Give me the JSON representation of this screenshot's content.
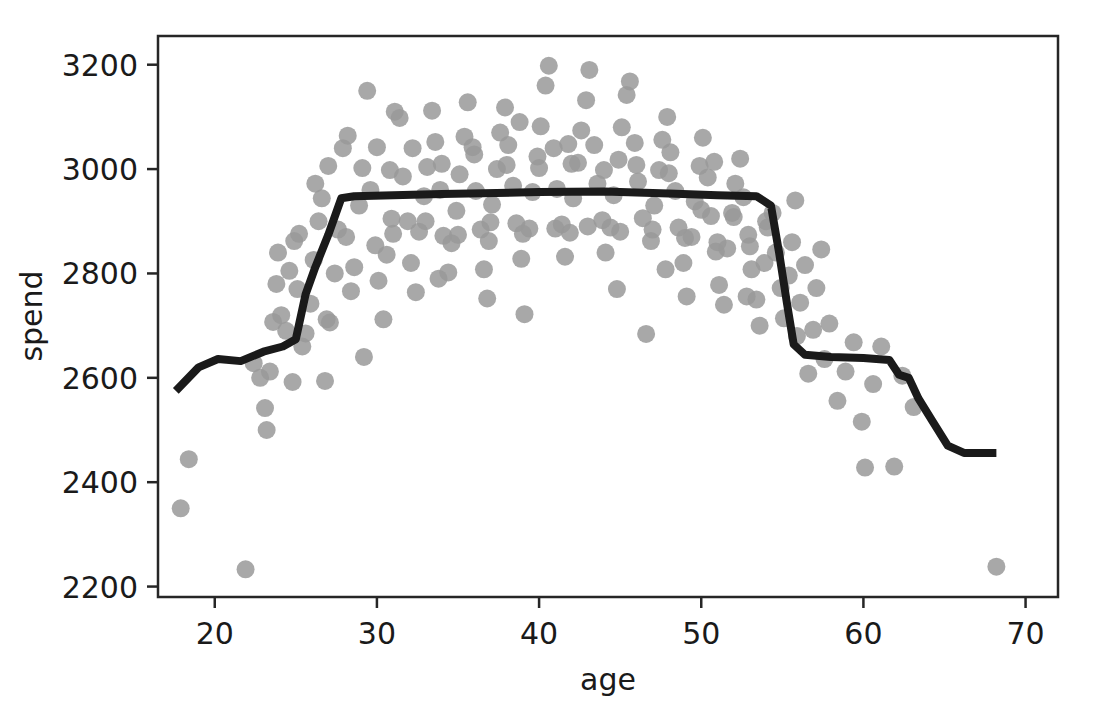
{
  "top_clipped_text": "",
  "chart_data": {
    "type": "scatter",
    "title": "",
    "xlabel": "age",
    "ylabel": "spend",
    "xlim": [
      16.5,
      72.0
    ],
    "ylim": [
      2180,
      3255
    ],
    "xticks": [
      20,
      30,
      40,
      50,
      60,
      70
    ],
    "yticks": [
      2200,
      2400,
      2600,
      2800,
      3000,
      3200
    ],
    "grid": false,
    "legend": null,
    "marker": {
      "shape": "circle",
      "color": "#999999",
      "size_px": 18,
      "alpha": 0.85
    },
    "series": [
      {
        "name": "observations",
        "type": "scatter",
        "points": [
          [
            17.9,
            2350
          ],
          [
            18.4,
            2444
          ],
          [
            21.9,
            2233
          ],
          [
            22.4,
            2628
          ],
          [
            23.1,
            2542
          ],
          [
            23.2,
            2500
          ],
          [
            23.4,
            2612
          ],
          [
            23.6,
            2707
          ],
          [
            23.9,
            2840
          ],
          [
            24.1,
            2720
          ],
          [
            24.4,
            2690
          ],
          [
            24.6,
            2805
          ],
          [
            24.9,
            2862
          ],
          [
            25.1,
            2770
          ],
          [
            25.4,
            2660
          ],
          [
            25.6,
            2685
          ],
          [
            25.9,
            2742
          ],
          [
            26.1,
            2826
          ],
          [
            26.4,
            2900
          ],
          [
            26.6,
            2944
          ],
          [
            26.9,
            2712
          ],
          [
            27.1,
            2706
          ],
          [
            27.4,
            2800
          ],
          [
            27.6,
            2884
          ],
          [
            27.9,
            3040
          ],
          [
            28.1,
            2870
          ],
          [
            28.4,
            2766
          ],
          [
            28.6,
            2812
          ],
          [
            28.9,
            2930
          ],
          [
            29.1,
            3002
          ],
          [
            29.4,
            3150
          ],
          [
            29.6,
            2960
          ],
          [
            29.9,
            2854
          ],
          [
            30.1,
            2786
          ],
          [
            30.4,
            2712
          ],
          [
            30.6,
            2836
          ],
          [
            30.9,
            2905
          ],
          [
            31.1,
            3110
          ],
          [
            31.4,
            3098
          ],
          [
            31.6,
            2986
          ],
          [
            31.9,
            2900
          ],
          [
            32.1,
            2820
          ],
          [
            32.4,
            2764
          ],
          [
            32.6,
            2880
          ],
          [
            32.9,
            2948
          ],
          [
            33.1,
            3004
          ],
          [
            33.4,
            3112
          ],
          [
            33.6,
            3052
          ],
          [
            33.9,
            2960
          ],
          [
            34.1,
            2872
          ],
          [
            34.4,
            2802
          ],
          [
            34.6,
            2858
          ],
          [
            34.9,
            2920
          ],
          [
            35.1,
            2990
          ],
          [
            35.4,
            3062
          ],
          [
            35.6,
            3128
          ],
          [
            35.9,
            3042
          ],
          [
            36.1,
            2958
          ],
          [
            36.4,
            2884
          ],
          [
            36.6,
            2808
          ],
          [
            36.9,
            2862
          ],
          [
            37.1,
            2932
          ],
          [
            37.4,
            3000
          ],
          [
            37.6,
            3070
          ],
          [
            37.9,
            3118
          ],
          [
            38.1,
            3046
          ],
          [
            38.4,
            2968
          ],
          [
            38.6,
            2896
          ],
          [
            38.9,
            2828
          ],
          [
            39.1,
            2722
          ],
          [
            39.4,
            2886
          ],
          [
            39.6,
            2956
          ],
          [
            39.9,
            3024
          ],
          [
            40.1,
            3082
          ],
          [
            40.4,
            3160
          ],
          [
            40.6,
            3198
          ],
          [
            40.9,
            3040
          ],
          [
            41.1,
            2962
          ],
          [
            41.4,
            2894
          ],
          [
            41.6,
            2832
          ],
          [
            41.9,
            2878
          ],
          [
            42.1,
            2944
          ],
          [
            42.4,
            3012
          ],
          [
            42.6,
            3074
          ],
          [
            42.9,
            3132
          ],
          [
            43.1,
            3190
          ],
          [
            43.4,
            3046
          ],
          [
            43.6,
            2972
          ],
          [
            43.9,
            2902
          ],
          [
            44.1,
            2840
          ],
          [
            44.4,
            2888
          ],
          [
            44.6,
            2950
          ],
          [
            44.9,
            3018
          ],
          [
            45.1,
            3080
          ],
          [
            45.4,
            3142
          ],
          [
            45.6,
            3168
          ],
          [
            45.9,
            3050
          ],
          [
            46.1,
            2976
          ],
          [
            46.4,
            2906
          ],
          [
            46.6,
            2684
          ],
          [
            46.9,
            2862
          ],
          [
            47.1,
            2930
          ],
          [
            47.4,
            2998
          ],
          [
            47.6,
            3056
          ],
          [
            47.9,
            3100
          ],
          [
            48.1,
            3032
          ],
          [
            48.4,
            2958
          ],
          [
            48.6,
            2888
          ],
          [
            48.9,
            2820
          ],
          [
            49.1,
            2756
          ],
          [
            49.4,
            2870
          ],
          [
            49.6,
            2938
          ],
          [
            49.9,
            3006
          ],
          [
            50.1,
            3060
          ],
          [
            50.4,
            2984
          ],
          [
            50.6,
            2910
          ],
          [
            50.9,
            2842
          ],
          [
            51.1,
            2778
          ],
          [
            51.4,
            2740
          ],
          [
            51.6,
            2848
          ],
          [
            51.9,
            2916
          ],
          [
            52.1,
            2972
          ],
          [
            52.4,
            3020
          ],
          [
            52.6,
            2946
          ],
          [
            52.9,
            2874
          ],
          [
            53.1,
            2808
          ],
          [
            53.4,
            2750
          ],
          [
            53.6,
            2700
          ],
          [
            53.9,
            2820
          ],
          [
            54.1,
            2888
          ],
          [
            54.4,
            2916
          ],
          [
            54.6,
            2840
          ],
          [
            54.9,
            2772
          ],
          [
            55.1,
            2714
          ],
          [
            55.4,
            2796
          ],
          [
            55.6,
            2860
          ],
          [
            55.9,
            2680
          ],
          [
            56.1,
            2744
          ],
          [
            56.4,
            2816
          ],
          [
            56.6,
            2608
          ],
          [
            56.9,
            2692
          ],
          [
            57.1,
            2772
          ],
          [
            57.4,
            2846
          ],
          [
            57.6,
            2636
          ],
          [
            57.9,
            2704
          ],
          [
            58.4,
            2556
          ],
          [
            58.9,
            2612
          ],
          [
            59.4,
            2668
          ],
          [
            59.9,
            2516
          ],
          [
            60.1,
            2428
          ],
          [
            60.6,
            2588
          ],
          [
            61.1,
            2660
          ],
          [
            61.9,
            2430
          ],
          [
            62.4,
            2604
          ],
          [
            63.1,
            2544
          ],
          [
            68.2,
            2238
          ],
          [
            26.2,
            2972
          ],
          [
            27.0,
            3006
          ],
          [
            28.2,
            3064
          ],
          [
            30.0,
            3042
          ],
          [
            31.0,
            2876
          ],
          [
            32.2,
            3040
          ],
          [
            33.0,
            2900
          ],
          [
            34.0,
            3010
          ],
          [
            35.0,
            2874
          ],
          [
            36.0,
            3028
          ],
          [
            37.0,
            2898
          ],
          [
            38.0,
            3008
          ],
          [
            39.0,
            2876
          ],
          [
            40.0,
            3002
          ],
          [
            41.0,
            2886
          ],
          [
            42.0,
            3010
          ],
          [
            43.0,
            2890
          ],
          [
            44.0,
            2998
          ],
          [
            45.0,
            2880
          ],
          [
            46.0,
            3008
          ],
          [
            47.0,
            2884
          ],
          [
            48.0,
            2992
          ],
          [
            49.0,
            2868
          ],
          [
            50.0,
            2922
          ],
          [
            51.0,
            2860
          ],
          [
            52.0,
            2908
          ],
          [
            53.0,
            2852
          ],
          [
            54.0,
            2900
          ],
          [
            26.8,
            2594
          ],
          [
            24.8,
            2592
          ],
          [
            25.2,
            2876
          ],
          [
            29.2,
            2640
          ],
          [
            30.8,
            2998
          ],
          [
            33.8,
            2790
          ],
          [
            36.8,
            2752
          ],
          [
            38.8,
            3090
          ],
          [
            41.8,
            3048
          ],
          [
            44.8,
            2770
          ],
          [
            47.8,
            2808
          ],
          [
            50.8,
            3014
          ],
          [
            52.8,
            2756
          ],
          [
            55.8,
            2940
          ],
          [
            23.8,
            2780
          ],
          [
            22.8,
            2600
          ]
        ]
      },
      {
        "name": "fitted-trend",
        "type": "line",
        "color": "#1a1a1a",
        "width_px": 8,
        "points": [
          [
            17.6,
            2575
          ],
          [
            19.0,
            2620
          ],
          [
            20.2,
            2636
          ],
          [
            21.6,
            2632
          ],
          [
            23.0,
            2650
          ],
          [
            24.2,
            2660
          ],
          [
            25.0,
            2674
          ],
          [
            25.6,
            2760
          ],
          [
            26.2,
            2812
          ],
          [
            27.0,
            2874
          ],
          [
            27.8,
            2944
          ],
          [
            28.6,
            2948
          ],
          [
            34.0,
            2952
          ],
          [
            40.0,
            2956
          ],
          [
            44.0,
            2957
          ],
          [
            48.0,
            2953
          ],
          [
            51.0,
            2950
          ],
          [
            53.4,
            2948
          ],
          [
            54.3,
            2930
          ],
          [
            54.8,
            2840
          ],
          [
            55.3,
            2740
          ],
          [
            55.7,
            2664
          ],
          [
            56.4,
            2644
          ],
          [
            58.0,
            2640
          ],
          [
            60.0,
            2638
          ],
          [
            61.6,
            2634
          ],
          [
            62.2,
            2606
          ],
          [
            62.8,
            2600
          ],
          [
            63.4,
            2560
          ],
          [
            64.2,
            2520
          ],
          [
            65.2,
            2470
          ],
          [
            66.2,
            2456
          ],
          [
            68.2,
            2456
          ]
        ]
      }
    ]
  }
}
